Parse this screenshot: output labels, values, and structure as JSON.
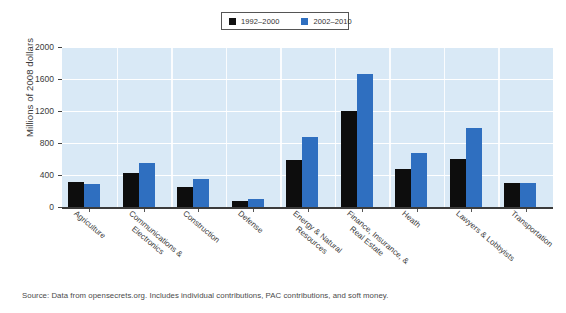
{
  "top_clip_text": "",
  "legend": {
    "items": [
      {
        "label": "1992–2000",
        "color": "#0d0d0d",
        "swatch_name": "legend-swatch-black"
      },
      {
        "label": "2002–2010",
        "color": "#2f6fc0",
        "swatch_name": "legend-swatch-blue"
      }
    ]
  },
  "source": {
    "text": "Source: Data from opensecrets.org. Includes individual contributions, PAC contributions, and soft money."
  },
  "chart_data": {
    "type": "bar",
    "title": "",
    "xlabel": "",
    "ylabel": "Millions of 2008 dollars",
    "ylim": [
      0,
      2000
    ],
    "yticks": [
      0,
      400,
      800,
      1200,
      1600,
      2000
    ],
    "ytick_labels": [
      "0",
      "400",
      "800",
      "1200",
      "1600",
      "2000"
    ],
    "grid": true,
    "grid_color": "#ffffff",
    "plot_background": "#d9e9f6",
    "legend_position": "top-center",
    "categories": [
      "Agriculture",
      "Communications & Electronics",
      "Construction",
      "Defense",
      "Energy & Natural Resources",
      "Finance, Insurance, & Real Estate",
      "Heath",
      "Lawyers & Lobbyists",
      "Transportation"
    ],
    "category_lines": [
      [
        "Agriculture"
      ],
      [
        "Communications &",
        "Electronics"
      ],
      [
        "Construction"
      ],
      [
        "Defense"
      ],
      [
        "Energy & Natural",
        "Resources"
      ],
      [
        "Finance, Insurance, &",
        "Real Estate"
      ],
      [
        "Heath"
      ],
      [
        "Lawyers & Lobbyists"
      ],
      [
        "Transportation"
      ]
    ],
    "series": [
      {
        "name": "1992–2000",
        "color": "#0d0d0d",
        "values": [
          310,
          430,
          245,
          75,
          590,
          1200,
          470,
          600,
          300
        ]
      },
      {
        "name": "2002–2010",
        "color": "#2f6fc0",
        "values": [
          285,
          550,
          350,
          105,
          875,
          1660,
          680,
          990,
          300
        ]
      }
    ]
  }
}
